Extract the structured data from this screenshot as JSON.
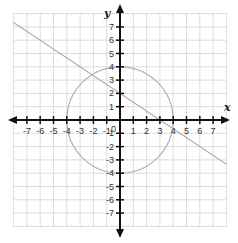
{
  "chart_data": {
    "type": "line",
    "title": "",
    "xlabel": "x",
    "ylabel": "y",
    "xlim": [
      -8,
      8
    ],
    "ylim": [
      -8,
      8
    ],
    "grid": true,
    "x_ticks": [
      -7,
      -6,
      -5,
      -4,
      -3,
      -2,
      -1,
      1,
      2,
      3,
      4,
      5,
      6,
      7
    ],
    "y_ticks": [
      -7,
      -6,
      -5,
      -4,
      -3,
      -2,
      -1,
      1,
      2,
      3,
      4,
      5,
      6,
      7
    ],
    "origin_label": "0",
    "series": [
      {
        "name": "line",
        "kind": "line",
        "equation": "y = -2/3 x + 2",
        "points": [
          [
            -8,
            7.33
          ],
          [
            8,
            -3.33
          ]
        ],
        "color": "#b0b0b0"
      },
      {
        "name": "circle",
        "kind": "circle",
        "equation": "x^2 + y^2 = 16",
        "center": [
          0,
          0
        ],
        "radius": 4,
        "color": "#b0b0b0"
      }
    ],
    "colors": {
      "grid": "#dcdcdc",
      "axis": "#111111",
      "curve": "#b0b0b0"
    }
  }
}
